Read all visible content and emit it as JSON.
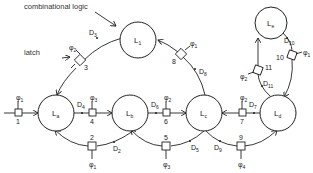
{
  "annotations": {
    "combinational_logic": "combinational logic",
    "latch": "latch"
  },
  "nodes": [
    {
      "id": "La",
      "label": "L",
      "sub": "a"
    },
    {
      "id": "Lb",
      "label": "L",
      "sub": "b"
    },
    {
      "id": "Lc",
      "label": "L",
      "sub": "c"
    },
    {
      "id": "Ld",
      "label": "L",
      "sub": "d"
    },
    {
      "id": "Le",
      "label": "L",
      "sub": "e"
    },
    {
      "id": "L1",
      "label": "L",
      "sub": "1"
    }
  ],
  "latches": [
    {
      "num": "1",
      "phase": "φ",
      "phase_sub": "1"
    },
    {
      "num": "2",
      "phase": "φ",
      "phase_sub": "1"
    },
    {
      "num": "3",
      "phase": "φ",
      "phase_sub": "2"
    },
    {
      "num": "4",
      "phase": "φ",
      "phase_sub": "3"
    },
    {
      "num": "5",
      "phase": "φ",
      "phase_sub": "3"
    },
    {
      "num": "6",
      "phase": "φ",
      "phase_sub": "2"
    },
    {
      "num": "7",
      "phase": "φ",
      "phase_sub": "2"
    },
    {
      "num": "8",
      "phase": "φ",
      "phase_sub": "1"
    },
    {
      "num": "9",
      "phase": "φ",
      "phase_sub": "4"
    },
    {
      "num": "10",
      "phase": "φ",
      "phase_sub": "1"
    },
    {
      "num": "11",
      "phase": "φ",
      "phase_sub": "2"
    }
  ],
  "delays": [
    {
      "label": "D",
      "sub": "2"
    },
    {
      "label": "D",
      "sub": "3"
    },
    {
      "label": "D",
      "sub": "4"
    },
    {
      "label": "D",
      "sub": "5"
    },
    {
      "label": "D",
      "sub": "6"
    },
    {
      "label": "D",
      "sub": "7"
    },
    {
      "label": "D",
      "sub": "8"
    },
    {
      "label": "D",
      "sub": "9"
    },
    {
      "label": "D",
      "sub": "10"
    },
    {
      "label": "D",
      "sub": "11"
    }
  ]
}
